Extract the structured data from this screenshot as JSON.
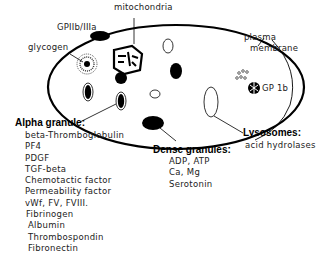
{
  "diagram": {
    "labels": {
      "mitochondria": "mitochondria",
      "gp2b3a": "GPIIb/IIIa",
      "glycogen": "glycogen",
      "plasma_membrane_line1": "plasma",
      "plasma_membrane_line2": "membrane",
      "gp1b": "GP 1b"
    },
    "alpha_granule": {
      "title": "Alpha granule:",
      "items": [
        "beta-Thromboglobulin",
        "PF4",
        "PDGF",
        "TGF-beta",
        "Chemotactic factor",
        "Permeability factor",
        "vWf, FV, FVIII.",
        "Fibrinogen",
        "Albumin",
        "Thrombospondin",
        "Fibronectin"
      ]
    },
    "dense_granules": {
      "title": "Dense granules:",
      "items": [
        "ADP, ATP",
        "Ca, Mg",
        "Serotonin"
      ]
    },
    "lysosomes": {
      "title": "Lysosomes:",
      "items": [
        "acid hydrolases"
      ]
    },
    "colors": {
      "ink": "#000000",
      "background": "#ffffff"
    }
  }
}
